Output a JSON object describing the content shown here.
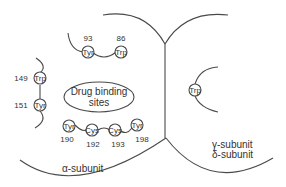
{
  "diagram": {
    "alpha_subunit_label": "α-subunit",
    "gamma_subunit_label": "γ-subunit",
    "delta_subunit_label": "δ-subunit",
    "drug_binding_line1": "Drug binding",
    "drug_binding_line2": "sites",
    "residues": [
      {
        "name": "Tyr",
        "number": "93"
      },
      {
        "name": "Trp",
        "number": "86"
      },
      {
        "name": "Trp",
        "number": "149"
      },
      {
        "name": "Tyr",
        "number": "151"
      },
      {
        "name": "Tyr",
        "number": "190"
      },
      {
        "name": "Cys",
        "number": "192"
      },
      {
        "name": "Cys",
        "number": "193"
      },
      {
        "name": "Tyr",
        "number": "198"
      },
      {
        "name": "Trp",
        "number": ""
      }
    ],
    "colors": {
      "line": "#4a4a4a",
      "text": "#333333",
      "background": "#ffffff"
    }
  }
}
